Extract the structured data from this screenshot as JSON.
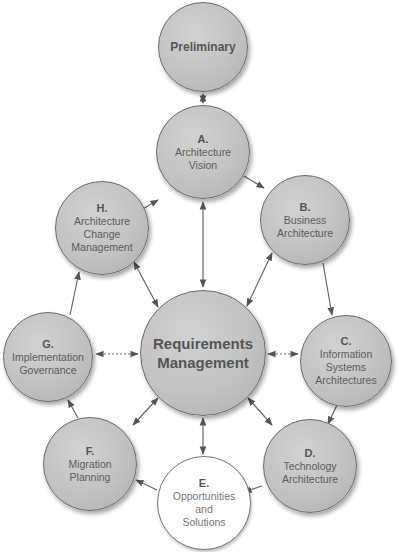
{
  "diagram": {
    "nodes": {
      "preliminary": {
        "label": "Preliminary"
      },
      "a": {
        "letter": "A.",
        "lines": [
          "Architecture",
          "Vision"
        ]
      },
      "b": {
        "letter": "B.",
        "lines": [
          "Business",
          "Architecture"
        ]
      },
      "c": {
        "letter": "C.",
        "lines": [
          "Information",
          "Systems",
          "Architectures"
        ]
      },
      "d": {
        "letter": "D.",
        "lines": [
          "Technology",
          "Architecture"
        ]
      },
      "e": {
        "letter": "E.",
        "lines": [
          "Opportunities",
          "and",
          "Solutions"
        ]
      },
      "f": {
        "letter": "F.",
        "lines": [
          "Migration",
          "Planning"
        ]
      },
      "g": {
        "letter": "G.",
        "lines": [
          "Implementation",
          "Governance"
        ]
      },
      "h": {
        "letter": "H.",
        "lines": [
          "Architecture",
          "Change",
          "Management"
        ]
      },
      "center": {
        "lines": [
          "Requirements",
          "Management"
        ]
      }
    },
    "edges": [
      {
        "from": "preliminary",
        "to": "a",
        "type": "bidirectional"
      },
      {
        "from": "a",
        "to": "b",
        "type": "directed"
      },
      {
        "from": "b",
        "to": "c",
        "type": "directed"
      },
      {
        "from": "c",
        "to": "d",
        "type": "directed"
      },
      {
        "from": "d",
        "to": "e",
        "type": "directed"
      },
      {
        "from": "e",
        "to": "f",
        "type": "directed"
      },
      {
        "from": "f",
        "to": "g",
        "type": "directed"
      },
      {
        "from": "g",
        "to": "h",
        "type": "directed"
      },
      {
        "from": "h",
        "to": "a",
        "type": "directed"
      },
      {
        "from": "center",
        "to": "a",
        "type": "bidirectional"
      },
      {
        "from": "center",
        "to": "b",
        "type": "bidirectional"
      },
      {
        "from": "center",
        "to": "c",
        "type": "bidirectional-dotted"
      },
      {
        "from": "center",
        "to": "d",
        "type": "bidirectional"
      },
      {
        "from": "center",
        "to": "e",
        "type": "bidirectional"
      },
      {
        "from": "center",
        "to": "f",
        "type": "bidirectional"
      },
      {
        "from": "center",
        "to": "g",
        "type": "bidirectional-dotted"
      },
      {
        "from": "center",
        "to": "h",
        "type": "bidirectional"
      }
    ],
    "colors": {
      "node_fill": "#c4c4c4",
      "node_border": "#6a6a6a",
      "arrow": "#555555",
      "text": "#5c5c5c"
    }
  }
}
